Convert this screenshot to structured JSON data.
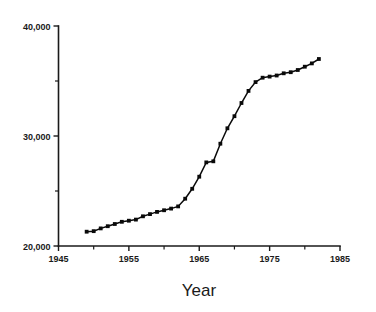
{
  "chart_data": {
    "type": "line",
    "title": "",
    "subtitle": "",
    "xlabel": "Year",
    "ylabel": "",
    "xlim": [
      1945,
      1985
    ],
    "ylim": [
      20000,
      40000
    ],
    "grid": false,
    "legend": null,
    "marker": "square",
    "x_tick_labels": [
      "1945",
      "1955",
      "1965",
      "1975",
      "1985"
    ],
    "x_ticks": [
      1945,
      1955,
      1965,
      1975,
      1985
    ],
    "x_minor_ticks": [
      1950,
      1960,
      1970,
      1980
    ],
    "y_tick_labels": [
      "20,000",
      "30,000",
      "40,000"
    ],
    "y_ticks": [
      20000,
      30000,
      40000
    ],
    "y_minor_ticks": [
      25000,
      35000
    ],
    "series": [
      {
        "name": "series-1",
        "x": [
          1949,
          1950,
          1951,
          1952,
          1953,
          1954,
          1955,
          1956,
          1957,
          1958,
          1959,
          1960,
          1961,
          1962,
          1963,
          1964,
          1965,
          1966,
          1967,
          1968,
          1969,
          1970,
          1971,
          1972,
          1973,
          1974,
          1975,
          1976,
          1977,
          1978,
          1979,
          1980,
          1981,
          1982
        ],
        "values": [
          21300,
          21350,
          21600,
          21800,
          22000,
          22200,
          22300,
          22400,
          22700,
          22900,
          23100,
          23250,
          23400,
          23600,
          24300,
          25200,
          26300,
          27600,
          27700,
          29300,
          30700,
          31800,
          33000,
          34100,
          34900,
          35300,
          35400,
          35500,
          35700,
          35800,
          36000,
          36300,
          36600,
          37000
        ]
      }
    ]
  },
  "axes": {
    "y_axis_name": "y-axis",
    "x_axis_name": "x-axis"
  },
  "colors": {
    "line": "#0a0a0a",
    "marker": "#0a0a0a",
    "axis": "#1a1a1a",
    "background": "#ffffff"
  }
}
